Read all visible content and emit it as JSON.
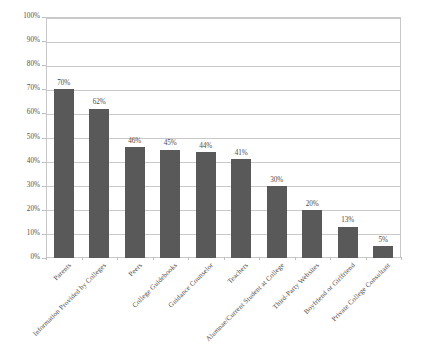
{
  "chart_data": {
    "type": "bar",
    "title": "",
    "subtitle": "",
    "xlabel": "",
    "ylabel": "",
    "ylim": [
      0,
      100
    ],
    "y_tick_labels": [
      "100%",
      "90%",
      "80%",
      "70%",
      "60%",
      "50%",
      "40%",
      "30%",
      "20%",
      "10%",
      "0%"
    ],
    "y_tick_values": [
      100,
      90,
      80,
      70,
      60,
      50,
      40,
      30,
      20,
      10,
      0
    ],
    "grid": "horizontal",
    "legend": "none",
    "bar_color": "#595959",
    "gridline_color": "#c9c9c9",
    "plot_border_color": "#c8c8c8",
    "background_color": "#ffffff",
    "categories": [
      "Parents",
      "Information Provided by Colleges",
      "Peers",
      "College Guidebooks",
      "Guidance Counselor",
      "Teachers",
      "Alumnae/Current Student at College",
      "Third-Party Websites",
      "Boyfriend or Girlfriend",
      "Private College Consultant"
    ],
    "values": [
      70,
      62,
      46,
      45,
      44,
      41,
      30,
      20,
      13,
      5
    ],
    "data_labels": [
      "70%",
      "62%",
      "46%",
      "45%",
      "44%",
      "41%",
      "30%",
      "20%",
      "13%",
      "5%"
    ]
  }
}
